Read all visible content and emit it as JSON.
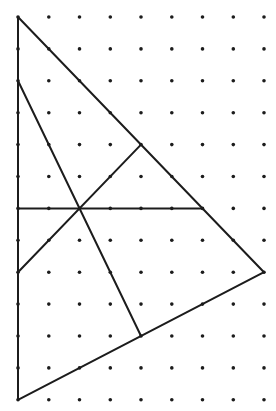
{
  "diagram": {
    "type": "geometry-dot-grid",
    "grid": {
      "columns": 9,
      "rows": 13,
      "origin_px": [
        18,
        17
      ],
      "spacing_px": [
        30.75,
        31.9
      ],
      "dot_radius": 1.8,
      "dot_color": "#1c1c1c"
    },
    "line_color": "#1c1c1c",
    "points": {
      "A": [
        0,
        0
      ],
      "B": [
        8,
        8
      ],
      "C": [
        0,
        12
      ],
      "D": [
        0,
        2
      ],
      "E": [
        4,
        10
      ],
      "F": [
        0,
        8
      ],
      "G": [
        4,
        4
      ],
      "H": [
        0,
        6
      ],
      "I": [
        6,
        6
      ],
      "O": [
        2,
        6
      ]
    },
    "segments": [
      {
        "name": "triangle-side-left",
        "from": "A",
        "to": "C"
      },
      {
        "name": "triangle-side-hypotenuse",
        "from": "A",
        "to": "B"
      },
      {
        "name": "triangle-side-bottom",
        "from": "C",
        "to": "B"
      },
      {
        "name": "interior-line-steep",
        "from": "D",
        "to": "E"
      },
      {
        "name": "interior-line-diagonal",
        "from": "F",
        "to": "G"
      },
      {
        "name": "interior-line-horizontal",
        "from": "H",
        "to": "I"
      }
    ]
  }
}
